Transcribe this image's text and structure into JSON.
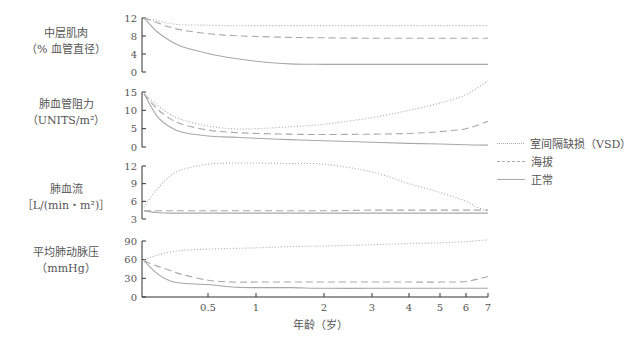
{
  "panels": [
    {
      "label_line1": "中层肌肉",
      "label_line2": "（% 血管直径）"
    },
    {
      "label_line1": "肺血管阻力",
      "label_line2": "（UNITS/m²）"
    },
    {
      "label_line1": "肺血流",
      "label_line2": "［L/(min・m²)］"
    },
    {
      "label_line1": "平均肺动脉压",
      "label_line2": "（mmHg）"
    }
  ],
  "xaxis": {
    "label": "年龄（岁）"
  },
  "legend": [
    {
      "label": "室间隔缺损（VSD）",
      "style": "dotted"
    },
    {
      "label": "海拔",
      "style": "dashed"
    },
    {
      "label": "正常",
      "style": "solid"
    }
  ],
  "chart_data": [
    {
      "type": "line",
      "title": "中层肌肉",
      "ylabel": "中层肌肉（% 血管直径）",
      "xlabel": "年龄（岁）",
      "x_ticks": [
        0.5,
        1,
        2,
        3,
        4,
        5,
        6,
        7
      ],
      "y_ticks": [
        0,
        4,
        8,
        12
      ],
      "ylim": [
        0,
        12
      ],
      "x": [
        0,
        0.1,
        0.2,
        0.3,
        0.5,
        0.75,
        1,
        1.5,
        2,
        3,
        4,
        5,
        6,
        7
      ],
      "series": [
        {
          "name": "室间隔缺损（VSD）",
          "style": "dotted",
          "values": [
            12,
            11.4,
            10.8,
            10.5,
            10.4,
            10.3,
            10.3,
            10.3,
            10.3,
            10.3,
            10.3,
            10.3,
            10.3,
            10.3
          ]
        },
        {
          "name": "海拔",
          "style": "dashed",
          "values": [
            12,
            11,
            10,
            9.3,
            8.5,
            8.1,
            7.9,
            7.7,
            7.6,
            7.5,
            7.5,
            7.5,
            7.5,
            7.5
          ]
        },
        {
          "name": "正常",
          "style": "solid",
          "values": [
            12,
            9,
            7,
            5.6,
            4.1,
            3.1,
            2.4,
            1.8,
            1.7,
            1.7,
            1.7,
            1.7,
            1.7,
            1.7
          ]
        }
      ]
    },
    {
      "type": "line",
      "title": "肺血管阻力",
      "ylabel": "肺血管阻力（UNITS/m²）",
      "xlabel": "年龄（岁）",
      "x_ticks": [
        0.5,
        1,
        2,
        3,
        4,
        5,
        6,
        7
      ],
      "y_ticks": [
        0,
        5,
        10,
        15
      ],
      "ylim": [
        0,
        15
      ],
      "x": [
        0,
        0.1,
        0.2,
        0.3,
        0.5,
        0.75,
        1,
        1.5,
        2,
        3,
        4,
        5,
        6,
        7
      ],
      "series": [
        {
          "name": "室间隔缺损（VSD）",
          "style": "dotted",
          "values": [
            14.5,
            11.5,
            9,
            7.4,
            5.7,
            5,
            5,
            5.5,
            6.2,
            8,
            10,
            12,
            14.3,
            18
          ]
        },
        {
          "name": "海拔",
          "style": "dashed",
          "values": [
            14.5,
            10.5,
            7.8,
            6.2,
            4.6,
            4,
            3.7,
            3.5,
            3.4,
            3.5,
            3.7,
            4.2,
            5,
            7
          ]
        },
        {
          "name": "正常",
          "style": "solid",
          "values": [
            14.5,
            8.5,
            5.5,
            4,
            3,
            2.7,
            2.4,
            2,
            1.7,
            1.3,
            1,
            0.8,
            0.6,
            0.5
          ]
        }
      ]
    },
    {
      "type": "line",
      "title": "肺血流",
      "ylabel": "肺血流［L/(min・m²)］",
      "xlabel": "年龄（岁）",
      "x_ticks": [
        0.5,
        1,
        2,
        3,
        4,
        5,
        6,
        7
      ],
      "y_ticks": [
        3,
        6,
        9,
        12
      ],
      "ylim": [
        3,
        12
      ],
      "x": [
        0,
        0.1,
        0.2,
        0.3,
        0.5,
        0.75,
        1,
        1.5,
        2,
        3,
        4,
        5,
        6,
        6.5,
        7
      ],
      "series": [
        {
          "name": "室间隔缺损（VSD）",
          "style": "dotted",
          "values": [
            5,
            8,
            10.2,
            11.4,
            12.3,
            12.5,
            12.5,
            12.4,
            12.3,
            11,
            9,
            7.5,
            6,
            5,
            4.4
          ]
        },
        {
          "name": "海拔",
          "style": "dashed",
          "values": [
            4.4,
            4.4,
            4.4,
            4.4,
            4.4,
            4.4,
            4.4,
            4.4,
            4.4,
            4.5,
            4.5,
            4.5,
            4.5,
            4.5,
            4.5
          ]
        },
        {
          "name": "正常",
          "style": "solid",
          "values": [
            4.4,
            4.1,
            4,
            4,
            4,
            4,
            4,
            4,
            4,
            4,
            4,
            4,
            4,
            4,
            4
          ]
        }
      ]
    },
    {
      "type": "line",
      "title": "平均肺动脉压",
      "ylabel": "平均肺动脉压（mmHg）",
      "xlabel": "年龄（岁）",
      "x_ticks": [
        0.5,
        1,
        2,
        3,
        4,
        5,
        6,
        7
      ],
      "y_ticks": [
        0,
        30,
        60,
        90
      ],
      "ylim": [
        0,
        90
      ],
      "x": [
        0,
        0.1,
        0.2,
        0.3,
        0.5,
        0.75,
        1,
        1.5,
        2,
        3,
        4,
        5,
        6,
        7
      ],
      "series": [
        {
          "name": "室间隔缺损（VSD）",
          "style": "dotted",
          "values": [
            60,
            67,
            72,
            75,
            77,
            78,
            79,
            81,
            82,
            84,
            86,
            87,
            89,
            92
          ]
        },
        {
          "name": "海拔",
          "style": "dashed",
          "values": [
            58,
            50,
            43,
            36,
            27,
            24,
            24,
            24,
            24,
            24,
            24,
            24,
            25,
            33
          ]
        },
        {
          "name": "正常",
          "style": "solid",
          "values": [
            58,
            38,
            26,
            22,
            20,
            16,
            15,
            15,
            14,
            14,
            14,
            14,
            14,
            14
          ]
        }
      ]
    }
  ]
}
